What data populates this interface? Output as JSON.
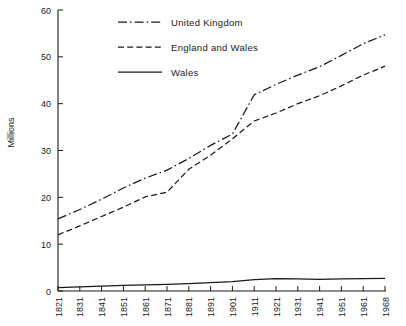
{
  "chart_data": {
    "type": "line",
    "title": "",
    "xlabel": "",
    "ylabel": "Millions",
    "xlim": [
      1821,
      1968
    ],
    "ylim": [
      0,
      60
    ],
    "grid": false,
    "legend_position": "top-center",
    "y_ticks": [
      0,
      10,
      20,
      30,
      40,
      50,
      60
    ],
    "y_tick_labels": [
      "0",
      "10",
      "20",
      "30",
      "40",
      "50",
      "60"
    ],
    "x": [
      1821,
      1831,
      1841,
      1851,
      1861,
      1871,
      1881,
      1891,
      1901,
      1911,
      1921,
      1931,
      1941,
      1951,
      1961,
      1968
    ],
    "x_tick_labels": [
      "1821",
      "1831",
      "1841",
      "1851",
      "1861",
      "1871",
      "1881",
      "1891",
      "1901",
      "1911",
      "1921",
      "1931",
      "1941",
      "1951",
      "1961",
      "1968"
    ],
    "series": [
      {
        "name": "United Kingdom",
        "style": "dash-dot",
        "color": "#1a1a1a",
        "values": [
          15.4,
          17.4,
          19.6,
          22.0,
          24.1,
          25.8,
          28.3,
          31.1,
          33.5,
          41.9,
          44.1,
          46.1,
          47.9,
          50.3,
          52.8,
          54.7
        ]
      },
      {
        "name": "England and Wales",
        "style": "dashed",
        "color": "#1a1a1a",
        "values": [
          12.0,
          13.9,
          15.9,
          17.9,
          20.1,
          21.1,
          26.0,
          29.0,
          32.5,
          36.3,
          38.0,
          40.0,
          41.7,
          43.8,
          46.1,
          48.0
        ]
      },
      {
        "name": "Wales",
        "style": "solid",
        "color": "#1a1a1a",
        "values": [
          0.72,
          0.9,
          1.05,
          1.19,
          1.29,
          1.41,
          1.57,
          1.77,
          2.01,
          2.42,
          2.66,
          2.59,
          2.49,
          2.6,
          2.64,
          2.72
        ]
      }
    ]
  },
  "legend": {
    "items": [
      {
        "label": "United Kingdom",
        "style": "dash-dot"
      },
      {
        "label": "England and Wales",
        "style": "dashed"
      },
      {
        "label": "Wales",
        "style": "solid"
      }
    ]
  },
  "axes": {
    "y_axis_label": "Millions"
  }
}
